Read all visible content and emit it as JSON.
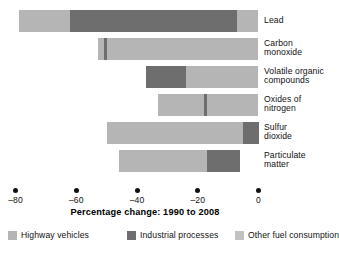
{
  "chart_data": {
    "type": "bar",
    "orientation": "horizontal",
    "stacked": true,
    "title": "",
    "xlabel": "Percentage change: 1990 to 2008",
    "ylabel": "",
    "xlim": [
      -85,
      2
    ],
    "xticks": [
      -80,
      -60,
      -40,
      -20,
      0
    ],
    "xtick_labels": [
      "–80",
      "–60",
      "–40",
      "–20",
      "0"
    ],
    "grid": false,
    "legend_position": "bottom",
    "categories": [
      "Lead",
      "Carbon monoxide",
      "Volatile organic compounds",
      "Oxides of nitrogen",
      "Sulfur dioxide",
      "Particulate matter"
    ],
    "category_label_lines": [
      "Lead",
      "Carbon\nmonoxide",
      "Volatile organic\ncompounds",
      "Oxides of\nnitrogen",
      "Sulfur\ndioxide",
      "Particulate\nmatter"
    ],
    "series": [
      {
        "name": "Highway vehicles",
        "color": "#b5b5b5",
        "values": [
          -17,
          -1,
          0,
          -15,
          -48,
          -29
        ]
      },
      {
        "name": "Industrial processes",
        "color": "#6e6e6e",
        "values": [
          -55,
          -1,
          -37,
          -1,
          -2,
          -11
        ]
      },
      {
        "name": "Other fuel consumption",
        "color": "#b5b5b5",
        "values": [
          -7,
          -51,
          -24,
          -17,
          0,
          0
        ]
      }
    ],
    "bar_totals": [
      -79,
      -53,
      -61,
      -33,
      -50,
      -40
    ],
    "bar_spans": [
      {
        "category": "Lead",
        "start": -79,
        "end": 0
      },
      {
        "category": "Carbon monoxide",
        "start": -53,
        "end": 0
      },
      {
        "category": "Volatile organic compounds",
        "start": -37,
        "end": 0
      },
      {
        "category": "Oxides of nitrogen",
        "start": -33,
        "end": 0
      },
      {
        "category": "Sulfur dioxide",
        "start": -50,
        "end": 0
      },
      {
        "category": "Particulate matter",
        "start": -46,
        "end": -6
      }
    ],
    "bar_segments": [
      [
        {
          "series": "Highway vehicles",
          "from": -79,
          "to": -62
        },
        {
          "series": "Industrial processes",
          "from": -62,
          "to": -7
        },
        {
          "series": "Other fuel consumption",
          "from": -7,
          "to": 0
        }
      ],
      [
        {
          "series": "Highway vehicles",
          "from": -53,
          "to": -51
        },
        {
          "series": "Industrial processes",
          "from": -51,
          "to": -50
        },
        {
          "series": "Other fuel consumption",
          "from": -50,
          "to": 0
        }
      ],
      [
        {
          "series": "Industrial processes",
          "from": -37,
          "to": -24
        },
        {
          "series": "Other fuel consumption",
          "from": -24,
          "to": 0
        }
      ],
      [
        {
          "series": "Highway vehicles",
          "from": -33,
          "to": -18
        },
        {
          "series": "Industrial processes",
          "from": -18,
          "to": -17
        },
        {
          "series": "Other fuel consumption",
          "from": -17,
          "to": 0
        }
      ],
      [
        {
          "series": "Highway vehicles",
          "from": -50,
          "to": -5
        },
        {
          "series": "Industrial processes",
          "from": -5,
          "to": 0
        }
      ],
      [
        {
          "series": "Highway vehicles",
          "from": -46,
          "to": -17
        },
        {
          "series": "Industrial processes",
          "from": -17,
          "to": -6
        }
      ]
    ]
  },
  "axis": {
    "title": "Percentage change: 1990 to 2008",
    "ticks": [
      {
        "value": -80,
        "label": "–80"
      },
      {
        "value": -60,
        "label": "–60"
      },
      {
        "value": -40,
        "label": "–40"
      },
      {
        "value": -20,
        "label": "–20"
      },
      {
        "value": 0,
        "label": "0"
      }
    ]
  },
  "legend": {
    "items": [
      {
        "label": "Highway vehicles",
        "color": "#b5b5b5"
      },
      {
        "label": "Industrial processes",
        "color": "#6e6e6e"
      },
      {
        "label": "Other fuel consumption",
        "color": "#c2c2c2"
      }
    ]
  },
  "categories": [
    {
      "label": "Lead"
    },
    {
      "label": "Carbon\nmonoxide"
    },
    {
      "label": "Volatile organic\ncompounds"
    },
    {
      "label": "Oxides of\nnitrogen"
    },
    {
      "label": "Sulfur\ndioxide"
    },
    {
      "label": "Particulate\nmatter"
    }
  ],
  "colors": {
    "highway_vehicles": "#b5b5b5",
    "industrial_processes": "#6e6e6e",
    "other_fuel_consumption": "#c2c2c2",
    "background": "#ffffff",
    "text": "#111111"
  }
}
